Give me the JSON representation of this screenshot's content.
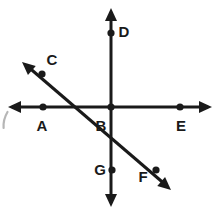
{
  "figure": {
    "canvas": {
      "width": 216,
      "height": 213
    },
    "background_color": "#ffffff",
    "ink_color": "#1a1a1a",
    "stroke_width": 3,
    "dot_radius": 3.6,
    "label_font_size": 15,
    "intersection": {
      "name": "B",
      "x": 111,
      "y": 107
    },
    "lines": [
      {
        "id": "line-horizontal",
        "name": "horizontal-line-AE",
        "through_points": [
          "A",
          "B",
          "E"
        ],
        "x1": 12,
        "y1": 107,
        "x2": 208,
        "y2": 107,
        "arrow_start": true,
        "arrow_end": true,
        "arrow_tip_start": {
          "x": 8,
          "y": 107
        },
        "arrow_tip_end": {
          "x": 212,
          "y": 107
        }
      },
      {
        "id": "line-vertical",
        "name": "vertical-line-DG",
        "through_points": [
          "D",
          "B",
          "G"
        ],
        "x1": 111,
        "y1": 12,
        "x2": 111,
        "y2": 203,
        "arrow_start": true,
        "arrow_end": true,
        "arrow_tip_start": {
          "x": 111,
          "y": 8
        },
        "arrow_tip_end": {
          "x": 111,
          "y": 207
        }
      },
      {
        "id": "line-diagonal",
        "name": "diagonal-line-CF",
        "through_points": [
          "C",
          "B",
          "F"
        ],
        "x1": 26,
        "y1": 65,
        "x2": 167,
        "y2": 186,
        "arrow_start": true,
        "arrow_end": true,
        "arrow_tip_start": {
          "x": 22,
          "y": 62
        },
        "arrow_tip_end": {
          "x": 171,
          "y": 190
        }
      }
    ],
    "points": [
      {
        "label": "A",
        "dot_x": 43,
        "dot_y": 107,
        "label_x": 42,
        "label_y": 127,
        "on_line": "line-horizontal",
        "has_dot": true
      },
      {
        "label": "B",
        "dot_x": 111,
        "dot_y": 107,
        "label_x": 101,
        "label_y": 127,
        "on_line": "intersection",
        "has_dot": true
      },
      {
        "label": "C",
        "dot_x": 42,
        "dot_y": 74,
        "label_x": 52,
        "label_y": 61,
        "on_line": "line-diagonal",
        "has_dot": true
      },
      {
        "label": "D",
        "dot_x": 111,
        "dot_y": 33,
        "label_x": 124,
        "label_y": 33,
        "on_line": "line-vertical",
        "has_dot": true
      },
      {
        "label": "E",
        "dot_x": 180,
        "dot_y": 107,
        "label_x": 181,
        "label_y": 127,
        "on_line": "line-horizontal",
        "has_dot": true
      },
      {
        "label": "F",
        "dot_x": 156,
        "dot_y": 170,
        "label_x": 143,
        "label_y": 178,
        "on_line": "line-diagonal",
        "has_dot": true
      },
      {
        "label": "G",
        "dot_x": 112,
        "dot_y": 170,
        "label_x": 100,
        "label_y": 171,
        "on_line": "line-vertical",
        "has_dot": true
      }
    ],
    "artifact": {
      "name": "scan-smudge",
      "description": "faint curved scan mark at left edge",
      "path": "M 7.5 112 C 4.5 117, 3.2 122, 3.6 128",
      "color": "#7a7a7a",
      "stroke_width": 2.2
    }
  }
}
